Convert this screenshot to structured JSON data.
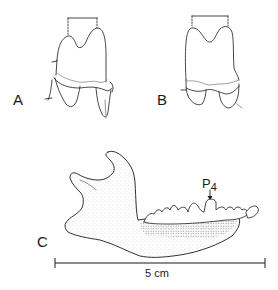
{
  "figure": {
    "panels": [
      {
        "id": "A",
        "label": "A",
        "content": "isolated molar, view A, with dashed bracket over cusps"
      },
      {
        "id": "B",
        "label": "B",
        "content": "isolated molar, view B, with dashed bracket over cusps"
      },
      {
        "id": "C",
        "label": "C",
        "content": "lower jaw (mandible) lateral view with tooth row"
      }
    ],
    "annotation": {
      "tooth": "P",
      "tooth_subscript": "4"
    },
    "scale_bar": {
      "label": "5 cm"
    },
    "colors": {
      "ink": "#1a1a1a",
      "stipple": "#555555",
      "background": "#ffffff"
    }
  }
}
